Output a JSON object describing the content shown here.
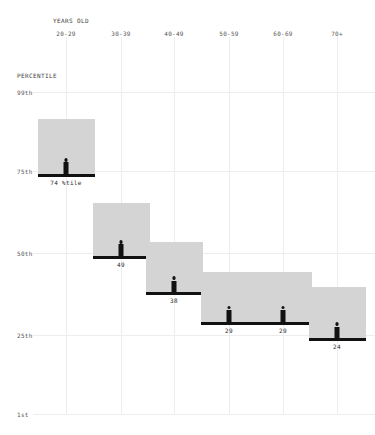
{
  "header": {
    "x_axis_title": "YEARS OLD",
    "y_axis_title": "PERCENTILE"
  },
  "chart_data": {
    "type": "bar",
    "title": "",
    "subtitle": "",
    "xlabel": "YEARS OLD",
    "ylabel": "PERCENTILE",
    "categories": [
      "20-29",
      "30-39",
      "40-49",
      "50-59",
      "60-69",
      "70+"
    ],
    "values": [
      74,
      49,
      38,
      29,
      29,
      24
    ],
    "value_labels": [
      "74 %tile",
      "49",
      "38",
      "29",
      "29",
      "24"
    ],
    "ylim": [
      1,
      99
    ],
    "ytick_values": [
      99,
      75,
      50,
      25,
      1
    ],
    "ytick_labels": [
      "99th",
      "75th",
      "50th",
      "25th",
      "1st"
    ],
    "grid": true,
    "legend": "none",
    "marker_icon": "person-icon",
    "colors": {
      "bar_fill": "#d4d4d4",
      "baseline": "#111111",
      "gridline": "#ededed",
      "text": "#555555",
      "background": "#ffffff"
    }
  }
}
